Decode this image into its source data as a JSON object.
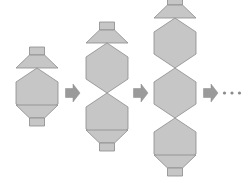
{
  "figure": {
    "background_color": "#ffffff",
    "width": 247,
    "height": 185
  },
  "style": {
    "shape_fill": "#c6c6c6",
    "shape_fill_light": "#cfcfcf",
    "shape_stroke": "#8a8a8a",
    "arrow_fill": "#9a9a9a",
    "arrow_stroke": "#8a8a8a",
    "ellipsis_color": "#8a8a8a",
    "stroke_width": 0.8
  },
  "sequence": {
    "description": "Each term adds one more hexagon to a vertical chain, capped top and bottom by a trapezoid and a small neck rectangle.",
    "terms": [
      {
        "index": 1,
        "name": "term-1",
        "hexagon_count": 1,
        "label": "1",
        "center_x": 37,
        "center_y": 93,
        "hex_width": 42,
        "hex_height": 50
      },
      {
        "index": 2,
        "name": "term-2",
        "hexagon_count": 2,
        "label": "2",
        "center_x": 107,
        "center_y": 93,
        "hex_width": 42,
        "hex_height": 50
      },
      {
        "index": 3,
        "name": "term-3",
        "hexagon_count": 3,
        "label": "3",
        "center_x": 175,
        "center_y": 93,
        "hex_width": 42,
        "hex_height": 50
      }
    ],
    "arrows": [
      {
        "name": "arrow-1",
        "x": 72,
        "y": 93,
        "label": "→"
      },
      {
        "name": "arrow-2",
        "x": 140,
        "y": 93,
        "label": "→"
      },
      {
        "name": "arrow-3",
        "x": 210,
        "y": 93,
        "label": "→"
      }
    ],
    "ellipsis": {
      "name": "ellipsis",
      "text": "…",
      "dots": 3,
      "x": 232,
      "y": 93
    }
  },
  "cap": {
    "trapezoid_top_width": 20,
    "trapezoid_height": 13,
    "neck_width": 15,
    "neck_height": 8
  }
}
